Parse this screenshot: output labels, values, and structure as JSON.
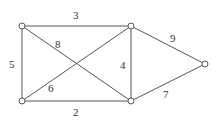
{
  "graph": {
    "nodes": [
      {
        "id": "A",
        "x": 22,
        "y": 26
      },
      {
        "id": "B",
        "x": 131,
        "y": 26
      },
      {
        "id": "C",
        "x": 22,
        "y": 101
      },
      {
        "id": "D",
        "x": 131,
        "y": 101
      },
      {
        "id": "E",
        "x": 205,
        "y": 64
      }
    ],
    "edges": [
      {
        "from": "A",
        "to": "B",
        "weight": "3"
      },
      {
        "from": "A",
        "to": "C",
        "weight": "5"
      },
      {
        "from": "A",
        "to": "D",
        "weight": "8"
      },
      {
        "from": "C",
        "to": "B",
        "weight": "6"
      },
      {
        "from": "C",
        "to": "D",
        "weight": "2"
      },
      {
        "from": "B",
        "to": "D",
        "weight": "4"
      },
      {
        "from": "B",
        "to": "E",
        "weight": "9"
      },
      {
        "from": "D",
        "to": "E",
        "weight": "7"
      }
    ]
  },
  "colors": {
    "line": "#555555",
    "node_fill": "#ffffff",
    "text": "#333333"
  }
}
